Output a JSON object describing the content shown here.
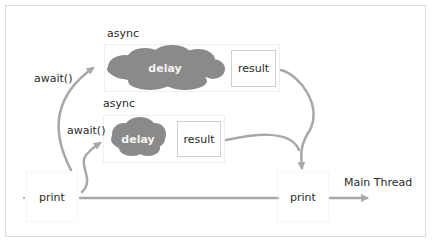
{
  "diagram": {
    "colors": {
      "cloud_fill": "#8a8a8a",
      "arrow_stroke": "#a8a8a8",
      "frame_border": "#dcdcdc",
      "box_border": "#cfcfcf"
    },
    "groups": [
      {
        "label": "async",
        "task": {
          "label": "delay",
          "icon": "cloud-icon"
        },
        "result": {
          "label": "result"
        }
      },
      {
        "label": "async",
        "task": {
          "label": "delay",
          "icon": "cloud-icon"
        },
        "result": {
          "label": "result"
        }
      }
    ],
    "await_labels": [
      "await()",
      "await()"
    ],
    "nodes": {
      "start_print": "print",
      "end_print": "print"
    },
    "main_thread_label": "Main Thread"
  }
}
